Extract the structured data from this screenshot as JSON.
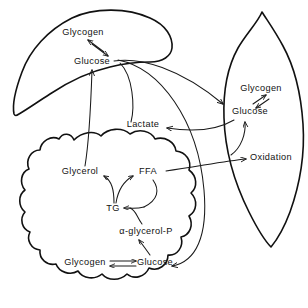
{
  "figure": {
    "type": "metabolic-pathway-diagram",
    "background_color": "#ffffff",
    "line_color": "#111111",
    "text_color": "#121212"
  },
  "organs": [
    {
      "id": "liver",
      "shape": "liver-outline"
    },
    {
      "id": "muscle",
      "shape": "muscle-spindle-outline"
    },
    {
      "id": "adipose",
      "shape": "adipose-cloud-outline"
    }
  ],
  "nodes": {
    "liver_glycogen": {
      "label": "Glycogen",
      "x": 83,
      "y": 33,
      "organ": "liver"
    },
    "liver_glucose": {
      "label": "Glucose",
      "x": 92,
      "y": 62,
      "organ": "liver"
    },
    "muscle_glycogen": {
      "label": "Glycogen",
      "x": 261,
      "y": 89,
      "organ": "muscle"
    },
    "muscle_glucose": {
      "label": "Glucose",
      "x": 250,
      "y": 112,
      "organ": "muscle"
    },
    "oxidation": {
      "label": "Oxidation",
      "x": 271,
      "y": 158,
      "organ": "muscle"
    },
    "lactate": {
      "label": "Lactate",
      "x": 143,
      "y": 125,
      "organ": "plasma"
    },
    "glycerol": {
      "label": "Glycerol",
      "x": 80,
      "y": 172,
      "organ": "adipose"
    },
    "ffa": {
      "label": "FFA",
      "x": 148,
      "y": 172,
      "organ": "adipose"
    },
    "tg": {
      "label": "TG",
      "x": 113,
      "y": 209,
      "organ": "adipose"
    },
    "alpha_glycerol_p": {
      "label": "α-glycerol-P",
      "x": 146,
      "y": 232,
      "organ": "adipose"
    },
    "adipose_glycogen": {
      "label": "Glycogen",
      "x": 85,
      "y": 263,
      "organ": "adipose"
    },
    "adipose_glucose": {
      "label": "Glucose",
      "x": 155,
      "y": 263,
      "organ": "adipose"
    }
  },
  "reactions": [
    {
      "id": "liver-glycogen-glucose",
      "from": "liver_glycogen",
      "to": "liver_glucose",
      "style": "double-arrow-reversible"
    },
    {
      "id": "muscle-glycogen-glucose",
      "from": "muscle_glycogen",
      "to": "muscle_glucose",
      "style": "double-arrow-reversible"
    },
    {
      "id": "adipose-glycogen-glucose",
      "from": "adipose_glycogen",
      "to": "adipose_glucose",
      "style": "double-arrow-reversible"
    },
    {
      "id": "liver-glucose-to-muscle-glucose",
      "from": "liver_glucose",
      "to": "muscle_glucose",
      "style": "curved-arrow"
    },
    {
      "id": "liver-glucose-to-adipose-glucose",
      "from": "liver_glucose",
      "to": "adipose_glucose",
      "style": "curved-arrow"
    },
    {
      "id": "liver-glucose-to-lactate",
      "from": "liver_glucose",
      "to": "lactate",
      "style": "curved-line"
    },
    {
      "id": "muscle-glucose-to-lactate",
      "from": "muscle_glucose",
      "to": "lactate",
      "style": "curved-arrow"
    },
    {
      "id": "muscle-glucose-to-oxidation",
      "from": "muscle_glucose",
      "to": "oxidation",
      "style": "curved-arrow"
    },
    {
      "id": "ffa-to-oxidation",
      "from": "ffa",
      "to": "oxidation",
      "style": "curved-arrow"
    },
    {
      "id": "glycerol-to-liver-glucose",
      "from": "glycerol",
      "to": "liver_glucose",
      "style": "curved-arrow"
    },
    {
      "id": "tg-to-glycerol",
      "from": "tg",
      "to": "glycerol",
      "style": "branch-arrow"
    },
    {
      "id": "tg-to-ffa",
      "from": "tg",
      "to": "ffa",
      "style": "branch-arrow"
    },
    {
      "id": "ffa-and-agp-to-tg",
      "from": "ffa",
      "to": "tg",
      "style": "merge-arrow"
    },
    {
      "id": "adipose-glucose-to-alpha-glycerol-p",
      "from": "adipose_glucose",
      "to": "alpha_glycerol_p",
      "style": "arrow"
    }
  ]
}
